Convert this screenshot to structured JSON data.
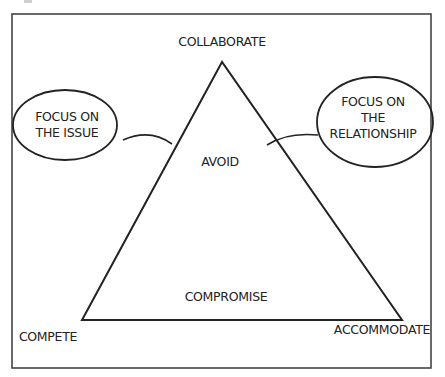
{
  "diagram": {
    "vertices": {
      "top": "COLLABORATE",
      "bottom_left": "COMPETE",
      "bottom_right": "ACCOMMODATE"
    },
    "interior": {
      "upper": "AVOID",
      "lower": "COMPROMISE"
    },
    "callouts": {
      "left": {
        "line1": "FOCUS ON",
        "line2": "THE ISSUE"
      },
      "right": {
        "line1": "FOCUS ON",
        "line2": "THE",
        "line3": "RELATIONSHIP"
      }
    },
    "colors": {
      "stroke": "#222222",
      "frame": "#444444",
      "background": "#ffffff"
    }
  }
}
